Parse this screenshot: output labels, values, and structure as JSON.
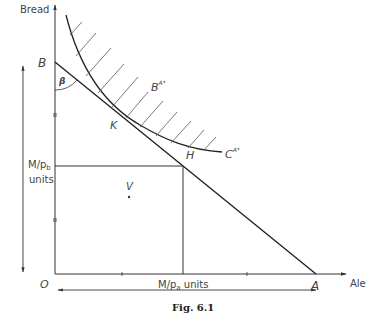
{
  "figure": {
    "caption": "Fig. 6.1",
    "axes": {
      "y_label": "Bread",
      "x_label": "Ale",
      "origin_label": "O"
    },
    "points": {
      "B": "B",
      "A": "A",
      "K": "K",
      "H": "H",
      "V": "V",
      "angle": "β"
    },
    "curves": {
      "upper_curve_label": "B",
      "upper_curve_sup": "A*",
      "lower_curve_label": "C",
      "lower_curve_sup": "A*"
    },
    "side_labels": {
      "vertical_main": "M/p",
      "vertical_sub": "b",
      "vertical_units": "units",
      "horizontal_main": "M/p",
      "horizontal_sub": "a",
      "horizontal_units": " units"
    },
    "colors": {
      "line": "#333333",
      "hatch": "#555555",
      "background": "#ffffff"
    }
  }
}
